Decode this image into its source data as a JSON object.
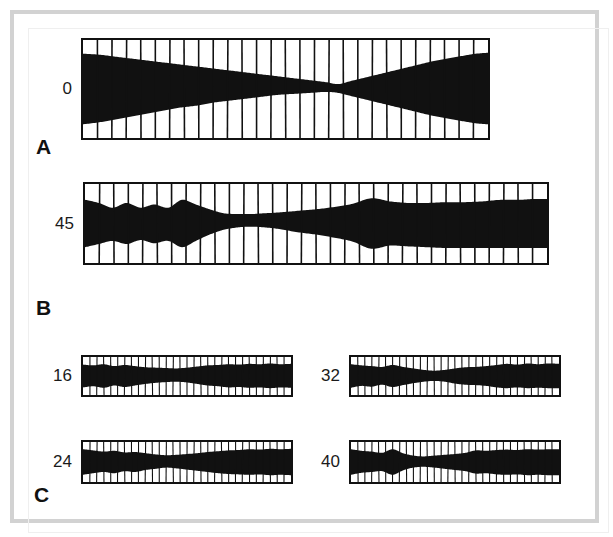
{
  "figure": {
    "background_color": "#ffffff",
    "ink_color": "#111111",
    "frame_color": "#d2d2d2",
    "panel_letters": [
      {
        "label": "A",
        "x": 36,
        "y": 136
      },
      {
        "label": "B",
        "x": 36,
        "y": 297
      },
      {
        "label": "C",
        "x": 34,
        "y": 484
      }
    ]
  },
  "chart_data": {
    "type": "area",
    "title": "",
    "subtitle": "",
    "xlabel": "",
    "ylabel": "",
    "grid": true,
    "legend_position": "none",
    "panels": [
      {
        "section": "A",
        "label": "0",
        "box": {
          "x": 81,
          "y": 38,
          "width": 409,
          "height": 102
        },
        "n_divisions": 28,
        "ylim": [
          0,
          1
        ],
        "envelope_note": "Wide at both ends, pinched to a narrow waist near 63% of the width (bowtie / hourglass).",
        "x": [
          0.0,
          0.04,
          0.08,
          0.12,
          0.16,
          0.2,
          0.24,
          0.28,
          0.32,
          0.36,
          0.4,
          0.44,
          0.48,
          0.52,
          0.56,
          0.6,
          0.63,
          0.66,
          0.7,
          0.74,
          0.78,
          0.82,
          0.86,
          0.9,
          0.94,
          0.97,
          1.0
        ],
        "upper": [
          0.86,
          0.85,
          0.83,
          0.81,
          0.79,
          0.77,
          0.75,
          0.73,
          0.71,
          0.69,
          0.67,
          0.65,
          0.63,
          0.61,
          0.59,
          0.57,
          0.55,
          0.58,
          0.62,
          0.66,
          0.7,
          0.74,
          0.78,
          0.81,
          0.84,
          0.86,
          0.87
        ],
        "lower": [
          0.14,
          0.16,
          0.19,
          0.22,
          0.25,
          0.28,
          0.31,
          0.33,
          0.36,
          0.38,
          0.4,
          0.42,
          0.44,
          0.45,
          0.46,
          0.47,
          0.46,
          0.43,
          0.39,
          0.35,
          0.31,
          0.27,
          0.23,
          0.2,
          0.17,
          0.15,
          0.14
        ]
      },
      {
        "section": "B",
        "label": "45",
        "box": {
          "x": 83,
          "y": 182,
          "width": 466,
          "height": 83
        },
        "n_divisions": 32,
        "ylim": [
          0,
          1
        ],
        "envelope_note": "Undulating band with three diamond lobes on the left, a thin waist near 38% of the width, then broadening to nearly full height across the right half.",
        "x": [
          0.0,
          0.03,
          0.06,
          0.09,
          0.12,
          0.15,
          0.18,
          0.21,
          0.24,
          0.27,
          0.3,
          0.33,
          0.36,
          0.39,
          0.42,
          0.46,
          0.5,
          0.54,
          0.58,
          0.62,
          0.66,
          0.7,
          0.74,
          0.78,
          0.82,
          0.86,
          0.9,
          0.94,
          0.97,
          1.0
        ],
        "upper": [
          0.8,
          0.76,
          0.7,
          0.76,
          0.7,
          0.74,
          0.7,
          0.8,
          0.74,
          0.68,
          0.63,
          0.62,
          0.62,
          0.63,
          0.64,
          0.66,
          0.68,
          0.71,
          0.75,
          0.82,
          0.78,
          0.76,
          0.76,
          0.77,
          0.77,
          0.78,
          0.8,
          0.8,
          0.81,
          0.81
        ],
        "lower": [
          0.2,
          0.24,
          0.28,
          0.24,
          0.29,
          0.25,
          0.28,
          0.2,
          0.28,
          0.36,
          0.42,
          0.45,
          0.46,
          0.45,
          0.43,
          0.39,
          0.36,
          0.32,
          0.27,
          0.18,
          0.22,
          0.21,
          0.2,
          0.19,
          0.19,
          0.19,
          0.19,
          0.19,
          0.19,
          0.19
        ]
      },
      {
        "section": "C",
        "label": "16",
        "box": {
          "x": 81,
          "y": 355,
          "width": 212,
          "height": 42
        },
        "n_divisions": 30,
        "ylim": [
          0,
          1
        ],
        "envelope_note": "Thick band, slight ripples, mild pinch near mid-width.",
        "x": [
          0.0,
          0.05,
          0.1,
          0.15,
          0.2,
          0.25,
          0.3,
          0.35,
          0.4,
          0.45,
          0.5,
          0.55,
          0.6,
          0.65,
          0.7,
          0.75,
          0.8,
          0.85,
          0.9,
          0.95,
          1.0
        ],
        "upper": [
          0.8,
          0.78,
          0.81,
          0.76,
          0.79,
          0.76,
          0.73,
          0.72,
          0.71,
          0.7,
          0.72,
          0.75,
          0.78,
          0.79,
          0.81,
          0.8,
          0.82,
          0.81,
          0.83,
          0.81,
          0.82
        ],
        "lower": [
          0.2,
          0.23,
          0.19,
          0.25,
          0.21,
          0.25,
          0.29,
          0.32,
          0.34,
          0.35,
          0.33,
          0.29,
          0.25,
          0.23,
          0.2,
          0.21,
          0.19,
          0.2,
          0.18,
          0.2,
          0.19
        ]
      },
      {
        "section": "C",
        "label": "32",
        "box": {
          "x": 349,
          "y": 355,
          "width": 212,
          "height": 42
        },
        "n_divisions": 30,
        "ylim": [
          0,
          1
        ],
        "envelope_note": "Band with a distinct narrow waist just past mid-width and a small lobe at about one third.",
        "x": [
          0.0,
          0.05,
          0.1,
          0.15,
          0.2,
          0.25,
          0.3,
          0.35,
          0.4,
          0.45,
          0.5,
          0.55,
          0.6,
          0.65,
          0.7,
          0.75,
          0.8,
          0.85,
          0.9,
          0.95,
          1.0
        ],
        "upper": [
          0.81,
          0.78,
          0.76,
          0.74,
          0.79,
          0.74,
          0.7,
          0.66,
          0.64,
          0.66,
          0.7,
          0.73,
          0.74,
          0.76,
          0.79,
          0.82,
          0.8,
          0.83,
          0.81,
          0.83,
          0.82
        ],
        "lower": [
          0.19,
          0.24,
          0.22,
          0.27,
          0.21,
          0.26,
          0.31,
          0.35,
          0.37,
          0.35,
          0.3,
          0.27,
          0.26,
          0.24,
          0.2,
          0.18,
          0.2,
          0.18,
          0.19,
          0.18,
          0.18
        ]
      },
      {
        "section": "C",
        "label": "24",
        "box": {
          "x": 81,
          "y": 440,
          "width": 212,
          "height": 44
        },
        "n_divisions": 30,
        "ylim": [
          0,
          1
        ],
        "envelope_note": "Band thins gradually toward mid-width then re-thickens toward the right end.",
        "x": [
          0.0,
          0.05,
          0.1,
          0.15,
          0.2,
          0.25,
          0.3,
          0.35,
          0.4,
          0.45,
          0.5,
          0.55,
          0.6,
          0.65,
          0.7,
          0.75,
          0.8,
          0.85,
          0.9,
          0.95,
          1.0
        ],
        "upper": [
          0.82,
          0.79,
          0.76,
          0.78,
          0.74,
          0.75,
          0.72,
          0.69,
          0.67,
          0.68,
          0.7,
          0.72,
          0.75,
          0.77,
          0.79,
          0.8,
          0.82,
          0.81,
          0.83,
          0.82,
          0.83
        ],
        "lower": [
          0.18,
          0.22,
          0.25,
          0.22,
          0.27,
          0.25,
          0.3,
          0.33,
          0.36,
          0.34,
          0.31,
          0.28,
          0.25,
          0.22,
          0.2,
          0.19,
          0.18,
          0.19,
          0.17,
          0.18,
          0.17
        ]
      },
      {
        "section": "C",
        "label": "40",
        "box": {
          "x": 349,
          "y": 440,
          "width": 212,
          "height": 44
        },
        "n_divisions": 30,
        "ylim": [
          0,
          1
        ],
        "envelope_note": "Pronounced diamond lobe near one quarter followed by a deep narrow waist, then broad to the right end.",
        "x": [
          0.0,
          0.05,
          0.1,
          0.15,
          0.2,
          0.25,
          0.3,
          0.35,
          0.4,
          0.45,
          0.5,
          0.55,
          0.6,
          0.65,
          0.7,
          0.75,
          0.8,
          0.85,
          0.9,
          0.95,
          1.0
        ],
        "upper": [
          0.82,
          0.78,
          0.76,
          0.73,
          0.82,
          0.72,
          0.66,
          0.64,
          0.66,
          0.68,
          0.7,
          0.73,
          0.79,
          0.78,
          0.8,
          0.81,
          0.8,
          0.82,
          0.81,
          0.82,
          0.82
        ],
        "lower": [
          0.18,
          0.23,
          0.25,
          0.27,
          0.18,
          0.29,
          0.36,
          0.38,
          0.36,
          0.33,
          0.3,
          0.27,
          0.21,
          0.22,
          0.19,
          0.18,
          0.19,
          0.17,
          0.18,
          0.17,
          0.17
        ]
      }
    ]
  }
}
